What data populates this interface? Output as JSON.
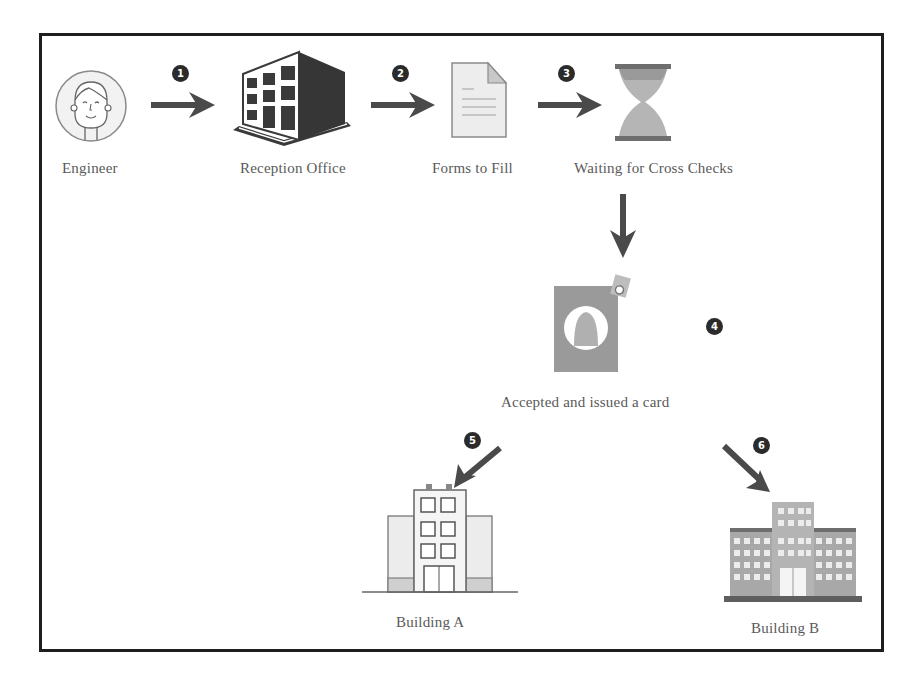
{
  "diagram": {
    "nodes": [
      {
        "id": "engineer",
        "label": "Engineer",
        "icon": "engineer-avatar-icon"
      },
      {
        "id": "reception",
        "label": "Reception Office",
        "icon": "office-building-icon"
      },
      {
        "id": "forms",
        "label": "Forms to Fill",
        "icon": "document-form-icon"
      },
      {
        "id": "waiting",
        "label": "Waiting for Cross Checks",
        "icon": "hourglass-icon"
      },
      {
        "id": "card",
        "label": "Accepted and issued a card",
        "icon": "id-card-icon"
      },
      {
        "id": "building_a",
        "label": "Building A",
        "icon": "building-a-icon"
      },
      {
        "id": "building_b",
        "label": "Building B",
        "icon": "building-b-icon"
      }
    ],
    "steps": [
      {
        "number": "1",
        "from": "engineer",
        "to": "reception"
      },
      {
        "number": "2",
        "from": "reception",
        "to": "forms"
      },
      {
        "number": "3",
        "from": "forms",
        "to": "waiting"
      },
      {
        "number": "4",
        "from": "waiting",
        "to": "card"
      },
      {
        "number": "5",
        "from": "card",
        "to": "building_a"
      },
      {
        "number": "6",
        "from": "card",
        "to": "building_b"
      }
    ]
  },
  "colors": {
    "border": "#1e1e1e",
    "arrow": "#4a4a4a",
    "badge": "#2b2b2b",
    "icon_gray": "#8f8f8f",
    "icon_dark": "#3a3a3a"
  }
}
